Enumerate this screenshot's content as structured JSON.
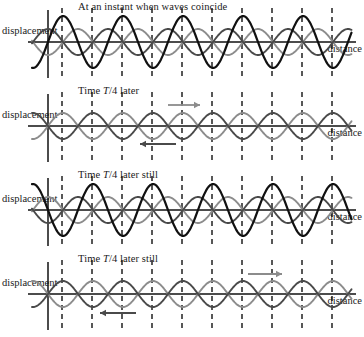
{
  "figure": {
    "axis_y_label": "displacement",
    "axis_x_label": "distance",
    "colors": {
      "sum_wave": "#111111",
      "wave_right": "#8c8c8c",
      "wave_left": "#4a4a4a",
      "axis": "#111111",
      "node_line": "#111111",
      "background": "#ffffff"
    }
  },
  "geometry": {
    "origin_x": 48,
    "baseline_y": 42,
    "wavelength_px": 60,
    "component_amplitude_px": 13,
    "node_spacing_px": 30,
    "first_node_x": 62,
    "node_count": 10,
    "node_line_top": 8,
    "node_line_bottom": 78
  },
  "panels": [
    {
      "id": "panel-instant-coincide",
      "caption_prefix": "At an instant when waves coincide",
      "caption_italic": "",
      "caption_suffix": "",
      "caption_plain": "At an instant when waves coincide",
      "axis_y_label": "displacement",
      "axis_x_label": "distance",
      "phase_right_deg": 90,
      "phase_left_deg": 90,
      "sum_amplitude_px": 26,
      "state": "constructive",
      "arrows": []
    },
    {
      "id": "panel-t4-later",
      "caption_prefix": "Time ",
      "caption_italic": "T",
      "caption_suffix": "/4  later",
      "caption_plain": "Time T/4  later",
      "axis_y_label": "displacement",
      "axis_x_label": "distance",
      "phase_right_deg": 0,
      "phase_left_deg": 180,
      "sum_amplitude_px": 0,
      "state": "destructive",
      "arrows": [
        {
          "name": "wave-right-direction-arrow",
          "direction": "right",
          "color": "#8c8c8c",
          "x1": 168,
          "x2": 200,
          "y": 21
        },
        {
          "name": "wave-left-direction-arrow",
          "direction": "left",
          "color": "#4a4a4a",
          "x1": 176,
          "x2": 140,
          "y": 60
        }
      ]
    },
    {
      "id": "panel-t4-later-still-1",
      "caption_prefix": "Time ",
      "caption_italic": "T",
      "caption_suffix": "/4  later still",
      "caption_plain": "Time T/4  later still",
      "axis_y_label": "displacement",
      "axis_x_label": "distance",
      "phase_right_deg": 270,
      "phase_left_deg": 270,
      "sum_amplitude_px": 26,
      "state": "constructive",
      "arrows": []
    },
    {
      "id": "panel-t4-later-still-2",
      "caption_prefix": "Time ",
      "caption_italic": "T",
      "caption_suffix": "/4  later still",
      "caption_plain": "Time T/4  later still",
      "axis_y_label": "displacement",
      "axis_x_label": "distance",
      "phase_right_deg": 180,
      "phase_left_deg": 0,
      "sum_amplitude_px": 0,
      "state": "destructive",
      "arrows": [
        {
          "name": "wave-left-direction-arrow",
          "direction": "left",
          "color": "#4a4a4a",
          "x1": 136,
          "x2": 100,
          "y": 61
        },
        {
          "name": "wave-right-direction-arrow",
          "direction": "right",
          "color": "#8c8c8c",
          "x1": 248,
          "x2": 282,
          "y": 22
        }
      ]
    }
  ]
}
